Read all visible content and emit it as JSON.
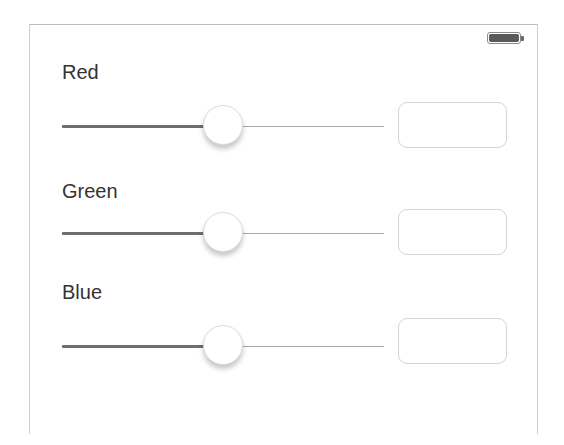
{
  "status_bar": {
    "battery_icon": "battery-full-icon",
    "battery_level_percent": 100
  },
  "colors": {
    "track_min": "#6d6d6d",
    "track_max": "#a9a9a9",
    "label_text": "#333333",
    "field_border": "#d4d4d4"
  },
  "controls": [
    {
      "label": "Red",
      "slider": {
        "value_fraction": 0.5
      },
      "field": {
        "value": "",
        "placeholder": ""
      }
    },
    {
      "label": "Green",
      "slider": {
        "value_fraction": 0.5
      },
      "field": {
        "value": "",
        "placeholder": ""
      }
    },
    {
      "label": "Blue",
      "slider": {
        "value_fraction": 0.5
      },
      "field": {
        "value": "",
        "placeholder": ""
      }
    }
  ]
}
